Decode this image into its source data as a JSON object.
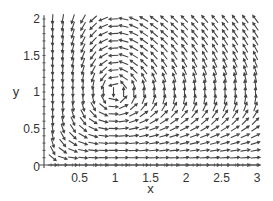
{
  "chart_data": {
    "type": "direction-field",
    "title": "",
    "xlabel": "x",
    "ylabel": "y",
    "xlim": [
      0,
      3.05
    ],
    "ylim": [
      0,
      2.05
    ],
    "x_ticks": [
      {
        "value": 0.5,
        "label": "0.5"
      },
      {
        "value": 1,
        "label": "1"
      },
      {
        "value": 1.5,
        "label": "1.5"
      },
      {
        "value": 2,
        "label": "2"
      },
      {
        "value": 2.5,
        "label": "2.5"
      },
      {
        "value": 3,
        "label": "3"
      }
    ],
    "y_ticks": [
      {
        "value": 0.5,
        "label": "0.5"
      },
      {
        "value": 1,
        "label": "1"
      },
      {
        "value": 1.5,
        "label": "1.5"
      },
      {
        "value": 2,
        "label": "2"
      }
    ],
    "origin_label": "0",
    "system": {
      "dx_dt": "x*(1 - y)",
      "dy_dt": "-y*(1 - x)",
      "equilibrium": [
        1,
        1
      ]
    },
    "grid": {
      "x_start": 0,
      "x_end": 3,
      "x_count": 21,
      "y_start": 0,
      "y_end": 2,
      "y_count": 21
    },
    "arrows_normalized": true,
    "grid_lines": false,
    "legend": "none",
    "colors": {
      "arrow": "#444444",
      "axis": "#555555",
      "text": "#333333"
    }
  }
}
